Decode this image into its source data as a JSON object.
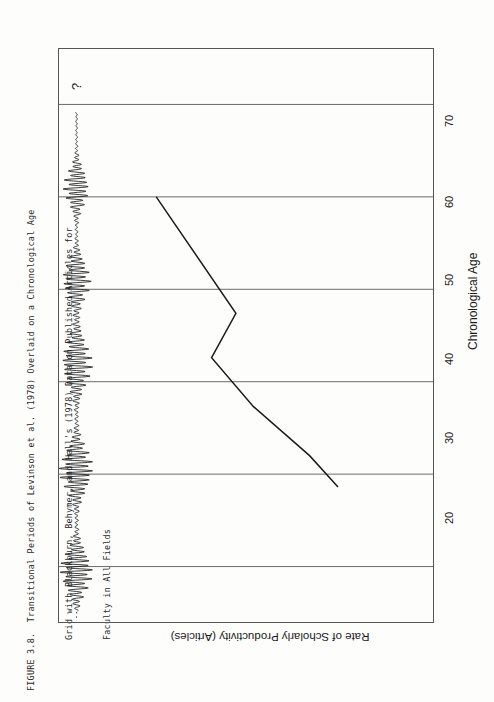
{
  "caption": {
    "line1": "FIGURE 3.8.  Transitional Periods of Levinson et al. (1978) Overlaid on a Chronological Age",
    "line2": "Grid with Blackburn, Behymer, and Hall's (1978) Data on Published Articles for",
    "line3": "Faculty in All Fields"
  },
  "chart_data": {
    "type": "line",
    "title": "",
    "xlabel": "Chronological Age",
    "ylabel": "Rate of Scholarly Productivity (Articles)",
    "xlim": [
      14,
      76
    ],
    "ylim": [
      0,
      1
    ],
    "xticks": [
      20,
      30,
      40,
      50,
      60,
      70
    ],
    "xticklabels": [
      "20",
      "30",
      "40",
      "50",
      "60",
      "70"
    ],
    "yticks": [],
    "yticklabels": [],
    "grid": "vertical-gridlines-at-xticks",
    "legend": "none",
    "annotations": [
      {
        "text": "?",
        "x": 72,
        "y": 0.955,
        "name": "uncertainty-marker"
      }
    ],
    "series": [
      {
        "name": "Rate of Scholarly Productivity (Articles)",
        "type": "line",
        "points": [
          {
            "x": 60.0,
            "y": 0.74
          },
          {
            "x": 47.4,
            "y": 0.527
          },
          {
            "x": 42.6,
            "y": 0.592
          },
          {
            "x": 37.3,
            "y": 0.48
          },
          {
            "x": 32.0,
            "y": 0.33
          },
          {
            "x": 28.6,
            "y": 0.254
          }
        ]
      },
      {
        "name": "Levinson Transitional Periods (oscillation trace)",
        "type": "oscillation",
        "baseline_y": 0.953,
        "description": "High-amplitude bursts mark Levinson transitional periods; low-amplitude stretches mark stable periods.",
        "bursts": [
          {
            "center_age": 19.5,
            "half_width": 3.0,
            "amplitude": 0.105
          },
          {
            "center_age": 30.5,
            "half_width": 3.2,
            "amplitude": 0.11
          },
          {
            "center_age": 42.0,
            "half_width": 3.4,
            "amplitude": 0.098
          },
          {
            "center_age": 51.0,
            "half_width": 2.8,
            "amplitude": 0.09
          },
          {
            "center_age": 61.0,
            "half_width": 2.6,
            "amplitude": 0.082
          }
        ],
        "stable_spans": [
          {
            "from_age": 23.0,
            "to_age": 27.5
          },
          {
            "from_age": 34.0,
            "to_age": 38.8
          },
          {
            "from_age": 45.5,
            "to_age": 48.5
          },
          {
            "from_age": 54.0,
            "to_age": 58.0
          },
          {
            "from_age": 63.5,
            "to_age": 67.5
          }
        ]
      }
    ]
  },
  "axis": {
    "x_title": "Chronological Age",
    "y_title": "Rate of Scholarly Productivity (Articles)",
    "tick_20": "20",
    "tick_30": "30",
    "tick_40": "40",
    "tick_50": "50",
    "tick_60": "60",
    "tick_70": "70"
  },
  "annotation": {
    "question": "?"
  },
  "colors": {
    "ink": "#1a1a1a",
    "frame": "#555555",
    "gridline": "#5a5a5a",
    "paper": "#fdfdfc"
  }
}
